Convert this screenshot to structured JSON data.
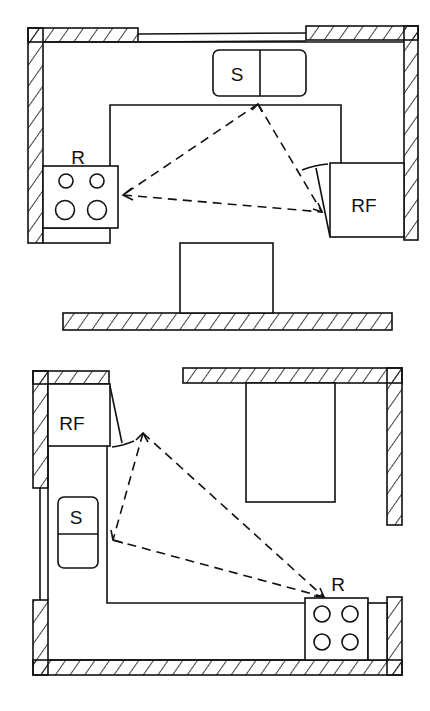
{
  "diagrams": [
    {
      "name": "u-shaped-kitchen",
      "labels": {
        "sink": "S",
        "range": "R",
        "refrigerator": "RF"
      }
    },
    {
      "name": "l-shaped-kitchen",
      "labels": {
        "sink": "S",
        "range": "R",
        "refrigerator": "RF"
      }
    }
  ],
  "colors": {
    "ink": "#111111",
    "background": "#ffffff"
  }
}
